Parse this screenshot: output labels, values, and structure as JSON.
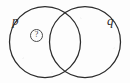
{
  "figure": {
    "type": "venn-diagram-two-set",
    "background_color": "#fdfdfd",
    "stroke_color": "#2b2b2b",
    "width": 130,
    "height": 83
  },
  "sets": [
    {
      "id": "p",
      "label": "p",
      "label_position": "upper-left",
      "circle": {
        "cx": 45,
        "cy": 42,
        "r": 35.5
      }
    },
    {
      "id": "q",
      "label": "q",
      "label_position": "upper-right",
      "circle": {
        "cx": 85,
        "cy": 42,
        "r": 35.5
      }
    }
  ],
  "markers": [
    {
      "id": "left-only-region",
      "glyph": "?",
      "shape": "circled",
      "region": "p-only",
      "x": 30,
      "y": 29
    }
  ],
  "intersections": [
    {
      "x": 65,
      "y": 9
    },
    {
      "x": 65,
      "y": 76
    }
  ]
}
